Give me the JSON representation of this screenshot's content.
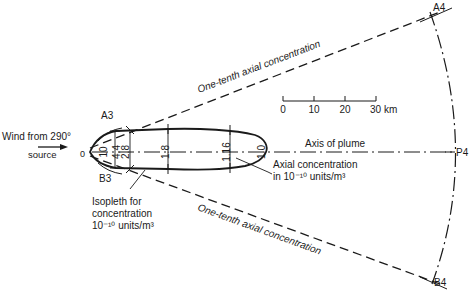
{
  "diagram": {
    "wind_label": "Wind from 290°",
    "source_label": "source",
    "origin_label": "0",
    "points": {
      "A3": "A3",
      "B3": "B3",
      "A4": "A4",
      "B4": "B4",
      "P4": "P4"
    },
    "upper_boundary_label": "One-tenth axial concentration",
    "lower_boundary_label": "One-tenth axial concentration",
    "axis_label": "Axis of plume",
    "axial_note": {
      "line1": "Axial concentration",
      "line2": "in 10⁻¹⁰ units/m³"
    },
    "isopleth_note": {
      "line1": "Isopleth for",
      "line2": "concentration",
      "line3": "10⁻¹⁰ units/m³"
    },
    "axial_values": [
      "10",
      "4.4",
      "2.8",
      "1.8",
      "1.16",
      "1.0"
    ],
    "scale_bar": {
      "ticks": [
        "0",
        "10",
        "20",
        "30 km"
      ],
      "unit": "km"
    },
    "colors": {
      "ink": "#1a1a1a",
      "paper": "#ffffff"
    }
  }
}
